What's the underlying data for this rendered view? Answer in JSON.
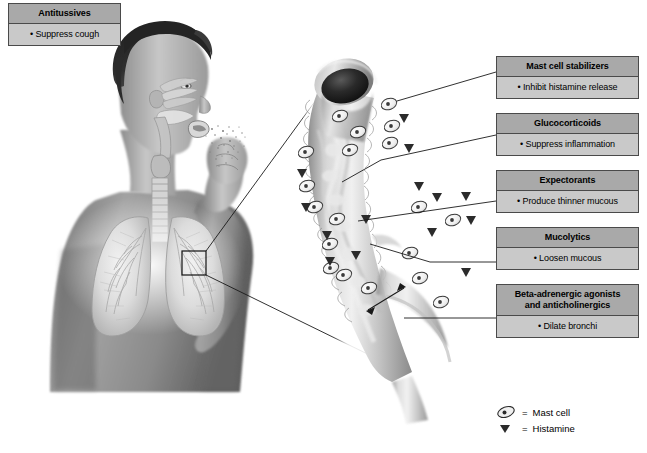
{
  "diagram": {
    "background_color": "#ffffff",
    "header_fill": "#a9a9a9",
    "body_fill": "#c9c9c9",
    "border_color": "#4a4a4a",
    "line_color": "#1a1a1a"
  },
  "boxes": [
    {
      "id": "antitussives",
      "header": "Antitussives",
      "bullet": "•",
      "body": "Suppress cough"
    },
    {
      "id": "mast-cell-stabilizers",
      "header": "Mast cell stabilizers",
      "bullet": "•",
      "body": "Inhibit histamine release"
    },
    {
      "id": "glucocorticoids",
      "header": "Glucocorticoids",
      "bullet": "•",
      "body": "Suppress inflammation"
    },
    {
      "id": "expectorants",
      "header": "Expectorants",
      "bullet": "•",
      "body": "Produce thinner mucous"
    },
    {
      "id": "mucolytics",
      "header": "Mucolytics",
      "bullet": "•",
      "body": "Loosen mucous"
    },
    {
      "id": "beta-adrenergic-agonists",
      "header_line1": "Beta-adrenergic agonists",
      "header_line2": "and anticholinergics",
      "bullet": "•",
      "body": "Dilate bronchi"
    }
  ],
  "legend": {
    "items": [
      {
        "symbol": "mast-cell",
        "equals": "=",
        "label": "Mast cell"
      },
      {
        "symbol": "histamine",
        "equals": "=",
        "label": "Histamine"
      }
    ]
  },
  "illustration": {
    "figure": "coughing-person-with-lungs",
    "inset_marker": "magnification-square-on-right-lung",
    "magnified": "bronchus-cross-section",
    "cough_droplets": "droplets-from-mouth",
    "mast_cell_count": 19,
    "histamine_count": 14,
    "dilation_arrow": "double-headed-arrow-across-bronchus-lumen"
  }
}
